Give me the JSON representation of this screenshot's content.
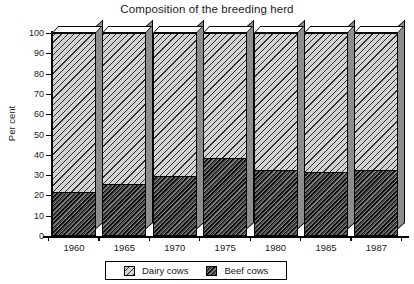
{
  "chart_data": {
    "type": "bar",
    "title": "Composition of the breeding herd",
    "xlabel": "",
    "ylabel": "Per cent",
    "ylim": [
      0,
      100
    ],
    "yticks": [
      0,
      10,
      20,
      30,
      40,
      50,
      60,
      70,
      80,
      90,
      100
    ],
    "ytick_labels": [
      "0",
      "10",
      "20",
      "30",
      "40",
      "50",
      "60",
      "70",
      "80",
      "90",
      "100"
    ],
    "categories": [
      "1960",
      "1965",
      "1970",
      "1975",
      "1980",
      "1985",
      "1987"
    ],
    "stacked": true,
    "grid": false,
    "legend_position": "bottom",
    "series": [
      {
        "name": "Beef cows",
        "values": [
          21,
          25,
          29,
          38,
          32,
          31,
          32
        ],
        "color": "#4a4a4a",
        "hatch": "dense-diagonal"
      },
      {
        "name": "Dairy cows",
        "values": [
          79,
          75,
          71,
          62,
          68,
          69,
          68
        ],
        "color": "#d2d2d2",
        "hatch": "light-diagonal"
      }
    ],
    "style": "3d-stacked-columns"
  },
  "legend": {
    "items": [
      {
        "label": "Dairy cows",
        "swatch": "light-diagonal-hatch"
      },
      {
        "label": "Beef cows",
        "swatch": "dense-diagonal-hatch"
      }
    ]
  }
}
